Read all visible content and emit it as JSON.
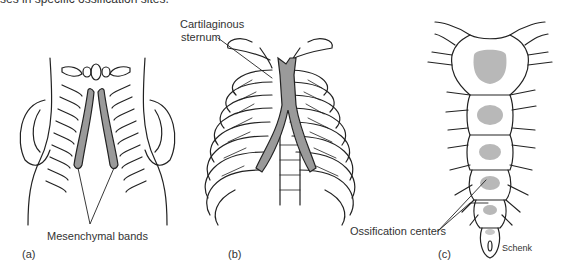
{
  "caption": {
    "text": "ses in specific ossification sites."
  },
  "panels": [
    {
      "id": "a",
      "label": "(a)",
      "annotations": [
        "Mesenchymal bands"
      ]
    },
    {
      "id": "b",
      "label": "(b)",
      "annotations": [
        "Cartilaginous",
        "sternum"
      ]
    },
    {
      "id": "c",
      "label": "(c)",
      "annotations": [
        "Ossification centers"
      ],
      "credit": "Schenk"
    }
  ],
  "colors": {
    "line": "#222222",
    "fill_gray": "#9a9a9a",
    "light_gray": "#b8b8b8",
    "background": "#ffffff"
  }
}
